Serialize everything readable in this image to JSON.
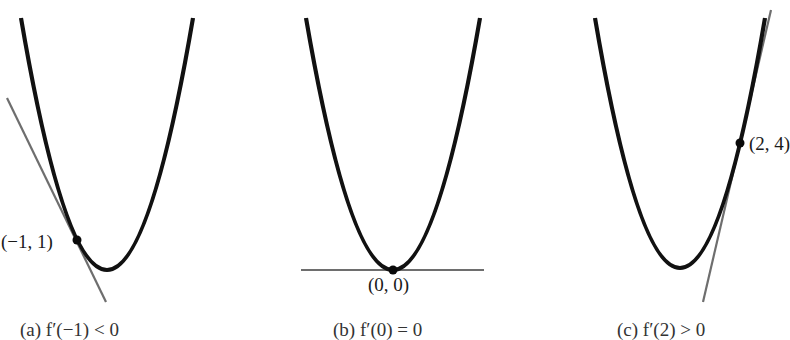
{
  "figure": {
    "colors": {
      "curve": "#111111",
      "tangent": "#6e6e6e",
      "point": "#0a0a0a",
      "text": "#1a1a1a"
    },
    "panels": [
      {
        "id": "a",
        "point_label": "(−1, 1)",
        "caption": "(a)  f′(−1) < 0",
        "tangent_slope_sign": "negative"
      },
      {
        "id": "b",
        "point_label": "(0, 0)",
        "caption": "(b)  f′(0) = 0",
        "tangent_slope_sign": "zero"
      },
      {
        "id": "c",
        "point_label": "(2, 4)",
        "caption": "(c)  f′(2) > 0",
        "tangent_slope_sign": "positive"
      }
    ]
  }
}
